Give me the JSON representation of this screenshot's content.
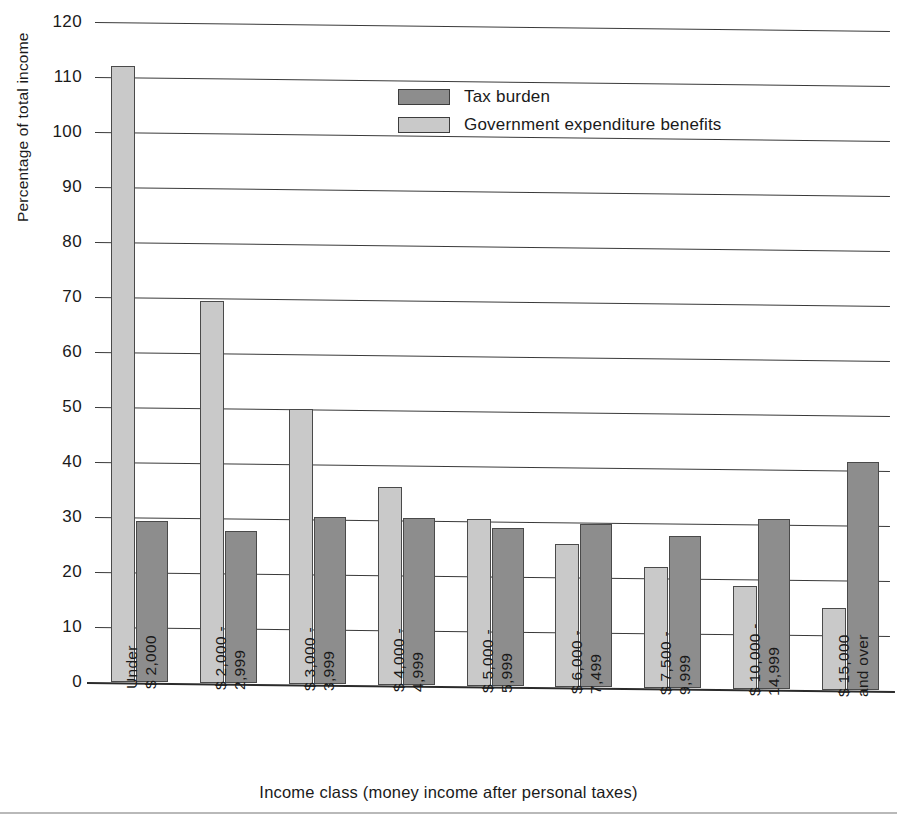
{
  "chart_data": {
    "type": "bar",
    "title": "",
    "xlabel": "Income class (money income after personal taxes)",
    "ylabel": "Percentage of total income",
    "ylim": [
      0,
      120
    ],
    "ytick_step": 10,
    "grid": true,
    "legend_position": "upper center",
    "categories": [
      "Under\n$ 2,000",
      "$ 2,000 -\n2,999",
      "$ 3,000 -\n3,999",
      "$ 4,000 -\n4,999",
      "$ 5,000 -\n5,999",
      "$ 6,000 -\n7,499",
      "$ 7,500 -\n9,999",
      "$ 10,000 -\n14,999",
      "$ 15,000\nand over"
    ],
    "series": [
      {
        "name": "Government expenditure benefits",
        "color": "#c9c9c9",
        "values": [
          112.0,
          69.5,
          50.0,
          36.0,
          30.3,
          26.0,
          22.0,
          18.7,
          15.0
        ]
      },
      {
        "name": "Tax burden",
        "color": "#8d8d8d",
        "values": [
          29.2,
          27.6,
          30.3,
          30.3,
          28.7,
          29.7,
          27.6,
          31.0,
          41.5
        ]
      }
    ],
    "yticks": [
      0,
      10,
      20,
      30,
      40,
      50,
      60,
      70,
      80,
      90,
      100,
      110,
      120
    ]
  },
  "legend": {
    "entries": [
      {
        "label": "Tax burden",
        "swatch": "dark"
      },
      {
        "label": "Government expenditure benefits",
        "swatch": "light"
      }
    ]
  },
  "axes": {
    "y_title": "Percentage of total income",
    "x_title": "Income class (money income after personal taxes)"
  },
  "x_tick_lines": [
    [
      "Under",
      "$ 2,000"
    ],
    [
      "$ 2,000 -",
      "2,999"
    ],
    [
      "$ 3,000 -",
      "3,999"
    ],
    [
      "$ 4,000 -",
      "4,999"
    ],
    [
      "$ 5,000 -",
      "5,999"
    ],
    [
      "$ 6,000 -",
      "7,499"
    ],
    [
      "$ 7,500 -",
      "9,999"
    ],
    [
      "$ 10,000 -",
      "14,999"
    ],
    [
      "$ 15,000",
      "and over"
    ]
  ]
}
